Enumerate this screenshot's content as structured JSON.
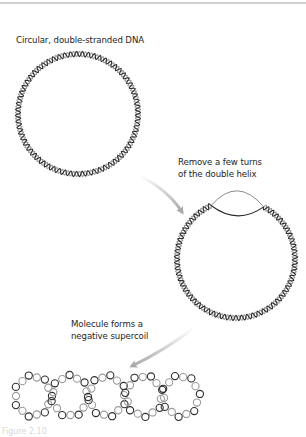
{
  "labels": {
    "step1": "Circular, double-stranded DNA",
    "step2_line1": "Remove a few turns",
    "step2_line2": "of the double helix",
    "step3_line1": "Molecule forms a",
    "step3_line2": "negative supercoil"
  },
  "caption": "Figure 2.10",
  "colors": {
    "strand_dark": "#2e2e2e",
    "strand_light": "#9a9a9a",
    "arrow": "#b5b5b5",
    "text": "#1e1e1e"
  },
  "figures": {
    "relaxed_circle": {
      "cx": 78,
      "cy": 114,
      "r": 60
    },
    "unwound_circle": {
      "cx": 236,
      "cy": 259,
      "r": 59,
      "bubble_start_deg": 245,
      "bubble_end_deg": 298
    },
    "supercoil": {
      "loops": 5,
      "cy": 396,
      "r": 18,
      "centers_x": [
        33,
        70,
        107,
        144,
        181
      ]
    }
  }
}
